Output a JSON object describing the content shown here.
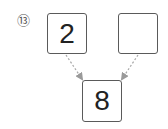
{
  "problem": {
    "number_label": "⑬",
    "number_bond": {
      "part_left": "2",
      "part_right": "",
      "whole": "8"
    },
    "arrows": [
      {
        "from": "part_left",
        "to": "whole",
        "style": "dashed"
      },
      {
        "from": "part_right",
        "to": "whole",
        "style": "dashed"
      }
    ],
    "colors": {
      "box_border": "#5a5a5a",
      "arrow": "#9a9a9a",
      "text": "#222222"
    }
  }
}
